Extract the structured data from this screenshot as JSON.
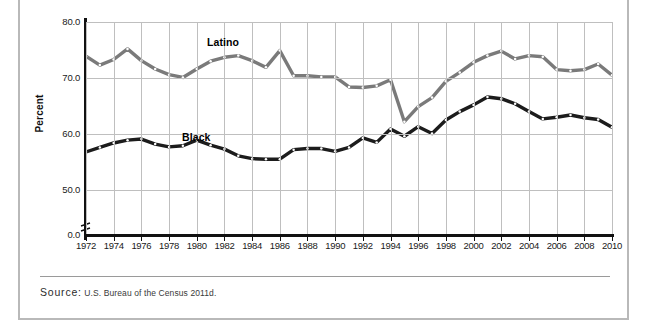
{
  "figure": {
    "source_word": "Source:",
    "source_text": "U.S. Bureau of the Census 2011d."
  },
  "colors": {
    "latino_line": "#7a7a7a",
    "black_line": "#1c1c1c",
    "grid": "#bfbfbf",
    "axis": "#111111",
    "marker_fill": "#ffffff",
    "frame": "#b9b9b9"
  },
  "chart_data": {
    "type": "line",
    "title": "",
    "xlabel": "",
    "ylabel": "Percent",
    "xlim": [
      1972,
      2010
    ],
    "ylim": [
      44.5,
      80.0
    ],
    "grid": true,
    "axis_break_at_zero": true,
    "ytick_labels": [
      "80.0",
      "70.0",
      "60.0",
      "50.0",
      "0.0"
    ],
    "ytick_values": [
      80.0,
      70.0,
      60.0,
      50.0,
      0.0
    ],
    "xtick_labels": [
      "1972",
      "1974",
      "1976",
      "1978",
      "1980",
      "1982",
      "1984",
      "1986",
      "1988",
      "1990",
      "1992",
      "1994",
      "1996",
      "1998",
      "2000",
      "2002",
      "2004",
      "2006",
      "2008",
      "2010"
    ],
    "x": [
      1972,
      1973,
      1974,
      1975,
      1976,
      1977,
      1978,
      1979,
      1980,
      1981,
      1982,
      1983,
      1984,
      1985,
      1986,
      1987,
      1988,
      1989,
      1990,
      1991,
      1992,
      1993,
      1994,
      1995,
      1996,
      1997,
      1998,
      1999,
      2000,
      2001,
      2002,
      2003,
      2004,
      2005,
      2006,
      2007,
      2008,
      2009,
      2010
    ],
    "legend_position": "inline-labels",
    "series": [
      {
        "name": "Latino",
        "color": "#7a7a7a",
        "label_x": 1987,
        "label_y": 77.2,
        "values": [
          73.9,
          72.3,
          73.3,
          75.2,
          73.1,
          71.6,
          70.6,
          70.1,
          71.6,
          73.0,
          73.7,
          74.0,
          73.1,
          71.9,
          74.9,
          70.4,
          70.4,
          70.2,
          70.2,
          68.4,
          68.3,
          68.6,
          69.7,
          62.2,
          64.9,
          66.5,
          69.4,
          71.0,
          72.8,
          74.0,
          74.8,
          73.4,
          74.0,
          73.8,
          71.5,
          71.3,
          71.5,
          72.5,
          70.5
        ]
      },
      {
        "name": "Black",
        "color": "#1c1c1c",
        "label_x": 1985,
        "label_y": 59.2,
        "values": [
          56.8,
          57.6,
          58.4,
          58.9,
          59.1,
          58.2,
          57.7,
          57.9,
          58.9,
          58.0,
          57.3,
          56.1,
          55.6,
          55.5,
          55.5,
          57.2,
          57.4,
          57.4,
          56.9,
          57.6,
          59.3,
          58.5,
          60.9,
          59.6,
          61.3,
          60.1,
          62.5,
          64.0,
          65.2,
          66.6,
          66.3,
          65.4,
          64.0,
          62.7,
          63.0,
          63.4,
          62.9,
          62.6,
          61.2
        ]
      }
    ]
  }
}
